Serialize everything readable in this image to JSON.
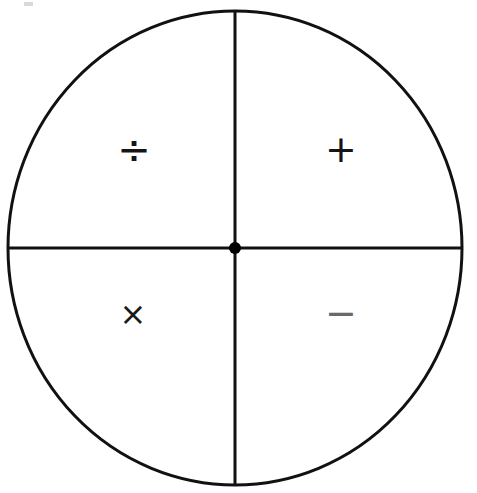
{
  "figure": {
    "background_color": "#ffffff",
    "stroke_color": "#111111"
  },
  "circle": {
    "center_x": 235,
    "center_y": 248,
    "radius_x": 227,
    "radius_y": 237,
    "stroke_width": 3
  },
  "axes": {
    "vertical": {
      "label": "vertical-divider",
      "x": 235,
      "y1": 11,
      "y2": 485,
      "stroke_width": 3
    },
    "horizontal": {
      "label": "horizontal-divider",
      "y": 248,
      "x1": 8,
      "x2": 462,
      "stroke_width": 3
    }
  },
  "center_point": {
    "label": "center-dot",
    "x": 235,
    "y": 248,
    "radius": 6,
    "fill": "#000000"
  },
  "quadrants": [
    {
      "id": "upper-left",
      "operator_name": "division-sign",
      "symbol": "÷",
      "x": 134,
      "y": 151
    },
    {
      "id": "upper-right",
      "operator_name": "plus-sign",
      "symbol": "+",
      "x": 341,
      "y": 152
    },
    {
      "id": "lower-left",
      "operator_name": "multiplication-sign",
      "symbol": "×",
      "x": 133,
      "y": 318
    },
    {
      "id": "lower-right",
      "operator_name": "minus-sign",
      "symbol": "−",
      "x": 341,
      "y": 316
    }
  ]
}
